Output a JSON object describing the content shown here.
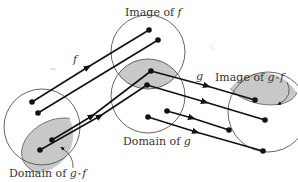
{
  "diagram": {
    "type": "function-composition-mapping",
    "labels": {
      "image_f_prefix": "Image of ",
      "image_f_func": "f",
      "f": "f",
      "g": "g",
      "image_gf_prefix": "Image of ",
      "image_gf_g": "g",
      "image_gf_circ": "∘",
      "image_gf_f": "f",
      "domain_g_prefix": "Domain of ",
      "domain_g_func": "g",
      "domain_gf_prefix": "Domain of ",
      "domain_gf_g": "g",
      "domain_gf_circ": "∘",
      "domain_gf_f": "f"
    },
    "colors": {
      "stroke": "#555555",
      "arrow": "#111111",
      "shade": "#c8c8c8",
      "text": "#333333"
    },
    "sets": [
      {
        "name": "domain-of-f",
        "shape": "circle"
      },
      {
        "name": "image-of-f",
        "shape": "circle"
      },
      {
        "name": "domain-of-g",
        "shape": "circle"
      },
      {
        "name": "codomain-of-g",
        "shape": "circle"
      },
      {
        "name": "domain-of-g-compose-f",
        "shape": "shaded-region"
      },
      {
        "name": "image-f-intersect-domain-g",
        "shape": "shaded-region"
      },
      {
        "name": "image-of-g-compose-f",
        "shape": "shaded-region"
      }
    ],
    "mappings": {
      "f": 4,
      "g": 4
    }
  }
}
